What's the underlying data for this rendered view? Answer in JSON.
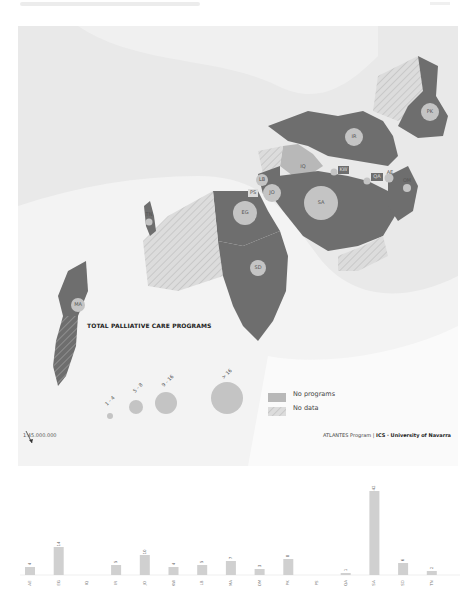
{
  "map": {
    "legend": {
      "title": "TOTAL PALLIATIVE CARE PROGRAMS",
      "sizes": [
        {
          "label": "1 - 4",
          "r": 3
        },
        {
          "label": "5 - 8",
          "r": 7
        },
        {
          "label": "9 - 16",
          "r": 11
        },
        {
          "label": "> 16",
          "r": 16
        }
      ],
      "categories": [
        {
          "label": "No programs",
          "style": "solid",
          "color": "#b8b8b8"
        },
        {
          "label": "No data",
          "style": "hatched",
          "color": "#d8d8d8"
        }
      ]
    },
    "countries": [
      {
        "code": "PK",
        "status": "programs"
      },
      {
        "code": "IR",
        "status": "programs"
      },
      {
        "code": "IQ",
        "status": "no-programs"
      },
      {
        "code": "KW",
        "status": "programs"
      },
      {
        "code": "QA",
        "status": "programs"
      },
      {
        "code": "AE",
        "status": "programs"
      },
      {
        "code": "OM",
        "status": "programs"
      },
      {
        "code": "LB",
        "status": "programs"
      },
      {
        "code": "JO",
        "status": "programs"
      },
      {
        "code": "PS",
        "status": "no-programs"
      },
      {
        "code": "SA",
        "status": "programs"
      },
      {
        "code": "EG",
        "status": "programs"
      },
      {
        "code": "SD",
        "status": "programs"
      },
      {
        "code": "TN",
        "status": "programs"
      },
      {
        "code": "MA",
        "status": "programs"
      }
    ],
    "scale": "1:45.000.000",
    "credit": {
      "program": "ATLANTES Program",
      "sep": "|",
      "org": "ICS · University of Navarra"
    },
    "colors": {
      "programs": "#6e6e6e",
      "no_programs": "#b8b8b8",
      "no_data": "#d8d8d8",
      "bubble": "#c4c4c4",
      "land": "#f4f4f4",
      "sea": "#e9e9e9"
    }
  },
  "chart_data": {
    "type": "bar",
    "title": "",
    "xlabel": "",
    "ylabel": "",
    "categories": [
      "AE",
      "EG",
      "IQ",
      "IR",
      "JO",
      "KW",
      "LB",
      "MA",
      "OM",
      "PK",
      "PS",
      "QA",
      "SA",
      "SD",
      "TN"
    ],
    "values": [
      4,
      14,
      0,
      5,
      10,
      4,
      5,
      7,
      3,
      8,
      0,
      1,
      42,
      6,
      2
    ],
    "ylim": [
      0,
      45
    ],
    "grid": false,
    "legend": "none",
    "bar_color": "#d0d0d0"
  }
}
